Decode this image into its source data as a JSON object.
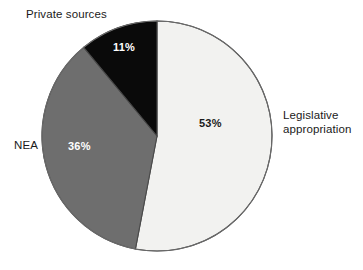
{
  "chart_data": {
    "type": "pie",
    "title": "",
    "subtitle": "",
    "xlabel": "",
    "ylabel": "",
    "legend_position": "none",
    "grid": false,
    "unit": "%",
    "start_angle_deg": 0,
    "direction": "clockwise",
    "categories": [
      "Legislative appropriation",
      "NEA",
      "Private sources"
    ],
    "values": [
      53,
      36,
      11
    ],
    "value_labels": [
      "53%",
      "36%",
      "11%"
    ],
    "colors": [
      "#f2f2f0",
      "#6e6e6e",
      "#0a0a0a"
    ],
    "label_text_colors": [
      "#1a1a1a",
      "#ffffff",
      "#ffffff"
    ],
    "outline_color": "#4a4a4a",
    "background": "#ffffff",
    "slices": [
      {
        "name": "Legislative appropriation",
        "label": "Legislative\nappropriation",
        "value": 53,
        "value_label": "53%",
        "color": "#f2f2f0",
        "value_text_color": "#1a1a1a"
      },
      {
        "name": "NEA",
        "label": "NEA",
        "value": 36,
        "value_label": "36%",
        "color": "#6e6e6e",
        "value_text_color": "#ffffff"
      },
      {
        "name": "Private sources",
        "label": "Private sources",
        "value": 11,
        "value_label": "11%",
        "color": "#0a0a0a",
        "value_text_color": "#ffffff"
      }
    ]
  }
}
